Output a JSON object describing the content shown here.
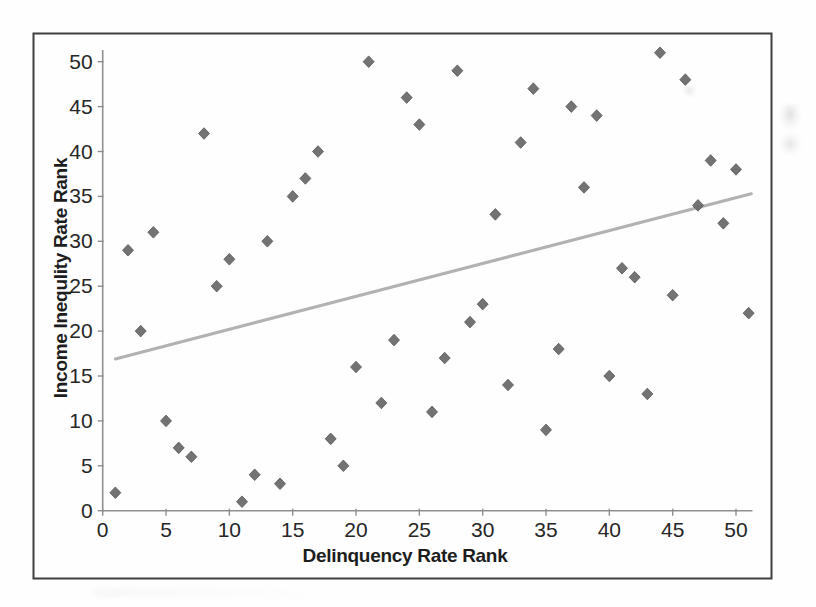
{
  "figure": {
    "background": "#fefefe",
    "border_color": "#3f3f3f",
    "axis_color": "#8f8f8f",
    "tick_label_color": "#262626",
    "title_color": "#1d1d1d"
  },
  "chart_data": {
    "type": "scatter",
    "title": "",
    "xlabel": "Delinquency Rate Rank",
    "ylabel": "Income Inequlity Rate Rank",
    "xlim": [
      0,
      51.5
    ],
    "ylim": [
      0,
      51.5
    ],
    "xticks": [
      0,
      5,
      10,
      15,
      20,
      25,
      30,
      35,
      40,
      45,
      50
    ],
    "yticks": [
      0,
      5,
      10,
      15,
      20,
      25,
      30,
      35,
      40,
      45,
      50
    ],
    "grid": false,
    "legend": "none",
    "marker": {
      "shape": "diamond",
      "color": "#686868",
      "edge_color": "#575757",
      "size_px": 11
    },
    "points": [
      [
        1,
        2
      ],
      [
        2,
        29
      ],
      [
        3,
        20
      ],
      [
        4,
        31
      ],
      [
        5,
        10
      ],
      [
        6,
        7
      ],
      [
        7,
        6
      ],
      [
        8,
        42
      ],
      [
        9,
        25
      ],
      [
        10,
        28
      ],
      [
        11,
        1
      ],
      [
        12,
        4
      ],
      [
        13,
        30
      ],
      [
        14,
        3
      ],
      [
        15,
        35
      ],
      [
        16,
        37
      ],
      [
        17,
        40
      ],
      [
        18,
        8
      ],
      [
        19,
        5
      ],
      [
        20,
        16
      ],
      [
        21,
        50
      ],
      [
        22,
        12
      ],
      [
        23,
        19
      ],
      [
        24,
        46
      ],
      [
        25,
        43
      ],
      [
        26,
        11
      ],
      [
        27,
        17
      ],
      [
        28,
        49
      ],
      [
        29,
        21
      ],
      [
        30,
        23
      ],
      [
        31,
        33
      ],
      [
        32,
        14
      ],
      [
        33,
        41
      ],
      [
        34,
        47
      ],
      [
        35,
        9
      ],
      [
        36,
        18
      ],
      [
        37,
        45
      ],
      [
        38,
        36
      ],
      [
        39,
        44
      ],
      [
        40,
        15
      ],
      [
        41,
        27
      ],
      [
        42,
        26
      ],
      [
        43,
        13
      ],
      [
        44,
        51
      ],
      [
        45,
        24
      ],
      [
        46,
        48
      ],
      [
        47,
        34
      ],
      [
        48,
        39
      ],
      [
        49,
        32
      ],
      [
        50,
        38
      ],
      [
        51,
        22
      ]
    ],
    "trendline": {
      "type": "linear",
      "x_start": 1,
      "y_start": 16.9,
      "x_end": 51.2,
      "y_end": 35.3,
      "color": "#aeaeae",
      "width_px": 3.1
    }
  }
}
